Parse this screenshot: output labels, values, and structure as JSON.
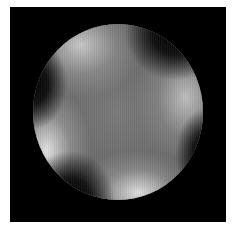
{
  "image": {
    "description": "Grayscale circular intensity pattern on black square with four dark lobes",
    "background_color": "#ffffff",
    "frame_color": "#000000",
    "disc": {
      "shape": "circle",
      "dark_lobes": [
        "top-right",
        "left",
        "bottom-left",
        "right"
      ],
      "bright_regions": [
        "top-left",
        "right-upper",
        "left-lower",
        "bottom"
      ]
    }
  }
}
